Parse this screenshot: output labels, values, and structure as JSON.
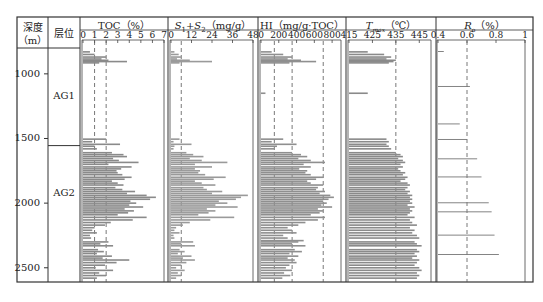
{
  "headers": {
    "depth": "深度",
    "depth_unit": "（m）",
    "layer": "层位",
    "toc": "TOC（%）",
    "s1s2": "S₁+S₂（mg/g）",
    "hi": "HI（mg/g·TOC）",
    "tmax": "Tmax（℃）",
    "ro": "Ro（%）"
  },
  "depth_ticks": [
    "1000",
    "1500",
    "2000",
    "2500"
  ],
  "layers": [
    {
      "name": "AG1",
      "top": 800,
      "bottom": 1555
    },
    {
      "name": "AG2",
      "top": 1555,
      "bottom": 2610
    }
  ],
  "chart_data": {
    "type": "bar",
    "orientation": "horizontal",
    "title": "",
    "ylabel": "深度（m）",
    "ylim": [
      800,
      2610
    ],
    "y_ticks": [
      1000,
      1500,
      2000,
      2500
    ],
    "tracks": [
      {
        "name": "TOC",
        "xlabel": "TOC（%）",
        "xlim": [
          0,
          7
        ],
        "x_ticks": [
          "0",
          "1",
          "2",
          "3",
          "4",
          "5",
          "6",
          "7"
        ],
        "ref_lines": [
          1,
          2
        ],
        "samples": [
          [
            830,
            0.6
          ],
          [
            850,
            1.0
          ],
          [
            870,
            2.0
          ],
          [
            885,
            1.6
          ],
          [
            895,
            2.2
          ],
          [
            905,
            3.8
          ],
          [
            915,
            1.4
          ],
          [
            1505,
            2.0
          ],
          [
            1525,
            0.8
          ],
          [
            1545,
            3.2
          ],
          [
            1560,
            1.0
          ],
          [
            1580,
            1.2
          ],
          [
            1610,
            2.5
          ],
          [
            1625,
            3.5
          ],
          [
            1640,
            3.8
          ],
          [
            1655,
            2.6
          ],
          [
            1670,
            3.1
          ],
          [
            1685,
            4.8
          ],
          [
            1700,
            2.2
          ],
          [
            1720,
            4.2
          ],
          [
            1735,
            3.3
          ],
          [
            1750,
            2.9
          ],
          [
            1765,
            3.0
          ],
          [
            1780,
            3.4
          ],
          [
            1800,
            4.2
          ],
          [
            1815,
            3.6
          ],
          [
            1830,
            2.5
          ],
          [
            1845,
            3.0
          ],
          [
            1860,
            3.5
          ],
          [
            1880,
            2.8
          ],
          [
            1895,
            3.4
          ],
          [
            1910,
            4.5
          ],
          [
            1925,
            3.8
          ],
          [
            1940,
            5.5
          ],
          [
            1955,
            6.3
          ],
          [
            1970,
            5.8
          ],
          [
            1985,
            4.1
          ],
          [
            2000,
            4.6
          ],
          [
            2015,
            4.0
          ],
          [
            2030,
            5.2
          ],
          [
            2045,
            3.6
          ],
          [
            2060,
            4.4
          ],
          [
            2075,
            3.9
          ],
          [
            2090,
            3.0
          ],
          [
            2110,
            5.5
          ],
          [
            2130,
            4.3
          ],
          [
            2150,
            2.4
          ],
          [
            2170,
            1.9
          ],
          [
            2190,
            1.0
          ],
          [
            2210,
            0.8
          ],
          [
            2230,
            1.2
          ],
          [
            2250,
            0.6
          ],
          [
            2270,
            0.7
          ],
          [
            2300,
            2.2
          ],
          [
            2315,
            1.5
          ],
          [
            2330,
            2.6
          ],
          [
            2360,
            1.3
          ],
          [
            2375,
            1.8
          ],
          [
            2390,
            1.2
          ],
          [
            2410,
            2.5
          ],
          [
            2425,
            1.7
          ],
          [
            2440,
            4.0
          ],
          [
            2460,
            2.9
          ],
          [
            2480,
            1.9
          ],
          [
            2500,
            1.1
          ],
          [
            2520,
            2.6
          ],
          [
            2540,
            1.4
          ],
          [
            2560,
            2.0
          ],
          [
            2580,
            1.2
          ]
        ]
      },
      {
        "name": "S1+S2",
        "xlabel": "S₁+S₂（mg/g）",
        "xlim": [
          0,
          48
        ],
        "x_ticks": [
          "0",
          "12",
          "24",
          "36",
          "48"
        ],
        "ref_lines": [
          6
        ],
        "samples": [
          [
            830,
            2.0
          ],
          [
            850,
            4.5
          ],
          [
            870,
            6.0
          ],
          [
            885,
            3.5
          ],
          [
            895,
            11.0
          ],
          [
            905,
            24.0
          ],
          [
            915,
            5.0
          ],
          [
            1505,
            5.0
          ],
          [
            1525,
            1.5
          ],
          [
            1545,
            12.0
          ],
          [
            1560,
            2.0
          ],
          [
            1580,
            1.5
          ],
          [
            1610,
            9.0
          ],
          [
            1625,
            13.0
          ],
          [
            1640,
            19.0
          ],
          [
            1655,
            11.0
          ],
          [
            1670,
            18.0
          ],
          [
            1685,
            33.0
          ],
          [
            1700,
            14.0
          ],
          [
            1720,
            24.0
          ],
          [
            1735,
            14.0
          ],
          [
            1750,
            17.0
          ],
          [
            1765,
            16.0
          ],
          [
            1780,
            20.0
          ],
          [
            1800,
            32.0
          ],
          [
            1815,
            25.0
          ],
          [
            1830,
            14.0
          ],
          [
            1845,
            18.0
          ],
          [
            1860,
            26.0
          ],
          [
            1880,
            19.0
          ],
          [
            1895,
            21.0
          ],
          [
            1910,
            30.0
          ],
          [
            1925,
            24.0
          ],
          [
            1940,
            45.0
          ],
          [
            1955,
            41.0
          ],
          [
            1970,
            38.0
          ],
          [
            1985,
            28.0
          ],
          [
            2000,
            33.0
          ],
          [
            2015,
            26.0
          ],
          [
            2030,
            39.0
          ],
          [
            2045,
            21.0
          ],
          [
            2060,
            26.0
          ],
          [
            2075,
            22.0
          ],
          [
            2090,
            16.0
          ],
          [
            2110,
            37.0
          ],
          [
            2130,
            23.0
          ],
          [
            2150,
            11.0
          ],
          [
            2170,
            7.0
          ],
          [
            2190,
            3.0
          ],
          [
            2210,
            2.0
          ],
          [
            2230,
            5.0
          ],
          [
            2250,
            1.5
          ],
          [
            2270,
            2.0
          ],
          [
            2300,
            13.0
          ],
          [
            2315,
            6.0
          ],
          [
            2330,
            14.0
          ],
          [
            2360,
            5.0
          ],
          [
            2375,
            8.0
          ],
          [
            2390,
            4.0
          ],
          [
            2410,
            12.0
          ],
          [
            2425,
            7.0
          ],
          [
            2440,
            14.0
          ],
          [
            2460,
            9.0
          ],
          [
            2480,
            6.0
          ],
          [
            2500,
            3.0
          ],
          [
            2520,
            8.0
          ],
          [
            2540,
            4.0
          ],
          [
            2560,
            6.0
          ],
          [
            2580,
            3.0
          ]
        ]
      },
      {
        "name": "HI",
        "xlabel": "HI（mg/g·TOC）",
        "xlim": [
          0,
          900
        ],
        "x_ticks": [
          "0",
          "200",
          "400",
          "600",
          "800"
        ],
        "ref_lines": [
          150,
          350,
          700
        ],
        "samples": [
          [
            830,
            120
          ],
          [
            850,
            250
          ],
          [
            870,
            350
          ],
          [
            885,
            300
          ],
          [
            895,
            450
          ],
          [
            905,
            620
          ],
          [
            915,
            320
          ],
          [
            1150,
            50
          ],
          [
            1505,
            250
          ],
          [
            1525,
            120
          ],
          [
            1545,
            400
          ],
          [
            1560,
            180
          ],
          [
            1580,
            150
          ],
          [
            1610,
            350
          ],
          [
            1625,
            450
          ],
          [
            1640,
            520
          ],
          [
            1655,
            420
          ],
          [
            1670,
            560
          ],
          [
            1685,
            720
          ],
          [
            1700,
            480
          ],
          [
            1720,
            560
          ],
          [
            1735,
            430
          ],
          [
            1750,
            520
          ],
          [
            1765,
            500
          ],
          [
            1780,
            560
          ],
          [
            1800,
            700
          ],
          [
            1815,
            620
          ],
          [
            1830,
            520
          ],
          [
            1845,
            560
          ],
          [
            1860,
            700
          ],
          [
            1880,
            640
          ],
          [
            1895,
            620
          ],
          [
            1910,
            720
          ],
          [
            1925,
            660
          ],
          [
            1940,
            780
          ],
          [
            1955,
            820
          ],
          [
            1970,
            760
          ],
          [
            1985,
            700
          ],
          [
            2000,
            740
          ],
          [
            2015,
            680
          ],
          [
            2030,
            800
          ],
          [
            2045,
            640
          ],
          [
            2060,
            700
          ],
          [
            2075,
            660
          ],
          [
            2090,
            560
          ],
          [
            2110,
            720
          ],
          [
            2130,
            640
          ],
          [
            2150,
            500
          ],
          [
            2170,
            420
          ],
          [
            2190,
            300
          ],
          [
            2210,
            350
          ],
          [
            2230,
            400
          ],
          [
            2250,
            250
          ],
          [
            2270,
            300
          ],
          [
            2290,
            480
          ],
          [
            2300,
            420
          ],
          [
            2315,
            350
          ],
          [
            2330,
            500
          ],
          [
            2360,
            380
          ],
          [
            2375,
            460
          ],
          [
            2390,
            320
          ],
          [
            2410,
            420
          ],
          [
            2425,
            300
          ],
          [
            2440,
            380
          ],
          [
            2460,
            400
          ],
          [
            2480,
            320
          ],
          [
            2500,
            280
          ],
          [
            2520,
            350
          ],
          [
            2540,
            260
          ],
          [
            2560,
            330
          ],
          [
            2580,
            240
          ]
        ]
      },
      {
        "name": "Tmax",
        "xlabel": "Tmax（℃）",
        "xlim": [
          415,
          450
        ],
        "x_ticks": [
          "415",
          "425",
          "435",
          "445"
        ],
        "ref_lines": [
          435
        ],
        "samples": [
          [
            830,
            423
          ],
          [
            850,
            430
          ],
          [
            870,
            433
          ],
          [
            885,
            431
          ],
          [
            895,
            435
          ],
          [
            905,
            434
          ],
          [
            915,
            432
          ],
          [
            1150,
            423
          ],
          [
            1505,
            431
          ],
          [
            1525,
            432
          ],
          [
            1545,
            431
          ],
          [
            1560,
            432
          ],
          [
            1580,
            433
          ],
          [
            1610,
            435
          ],
          [
            1625,
            437
          ],
          [
            1640,
            438
          ],
          [
            1655,
            436
          ],
          [
            1670,
            438
          ],
          [
            1685,
            439
          ],
          [
            1700,
            437
          ],
          [
            1720,
            438
          ],
          [
            1735,
            436
          ],
          [
            1750,
            437
          ],
          [
            1765,
            439
          ],
          [
            1780,
            438
          ],
          [
            1800,
            440
          ],
          [
            1815,
            439
          ],
          [
            1830,
            437
          ],
          [
            1845,
            440
          ],
          [
            1860,
            441
          ],
          [
            1880,
            440
          ],
          [
            1895,
            439
          ],
          [
            1910,
            441
          ],
          [
            1925,
            440
          ],
          [
            1940,
            442
          ],
          [
            1955,
            441
          ],
          [
            1970,
            442
          ],
          [
            1985,
            441
          ],
          [
            2000,
            442
          ],
          [
            2015,
            440
          ],
          [
            2030,
            443
          ],
          [
            2045,
            441
          ],
          [
            2060,
            442
          ],
          [
            2075,
            441
          ],
          [
            2090,
            440
          ],
          [
            2110,
            443
          ],
          [
            2130,
            441
          ],
          [
            2150,
            442
          ],
          [
            2170,
            444
          ],
          [
            2190,
            441
          ],
          [
            2210,
            443
          ],
          [
            2230,
            442
          ],
          [
            2250,
            444
          ],
          [
            2270,
            445
          ],
          [
            2300,
            443
          ],
          [
            2315,
            444
          ],
          [
            2330,
            446
          ],
          [
            2360,
            444
          ],
          [
            2375,
            445
          ],
          [
            2390,
            443
          ],
          [
            2410,
            444
          ],
          [
            2425,
            442
          ],
          [
            2440,
            445
          ],
          [
            2460,
            444
          ],
          [
            2480,
            443
          ],
          [
            2500,
            445
          ],
          [
            2520,
            446
          ],
          [
            2540,
            444
          ],
          [
            2560,
            445
          ],
          [
            2580,
            444
          ]
        ]
      },
      {
        "name": "Ro",
        "xlabel": "Ro（%）",
        "xlim": [
          0.4,
          1.0
        ],
        "x_ticks": [
          "0.4",
          "0.6",
          "0.8",
          "1"
        ],
        "ref_lines": [
          0.6
        ],
        "samples": [
          [
            830,
            0.44
          ],
          [
            1100,
            0.62
          ],
          [
            1390,
            0.55
          ],
          [
            1510,
            0.6
          ],
          [
            1660,
            0.67
          ],
          [
            1800,
            0.7
          ],
          [
            2000,
            0.75
          ],
          [
            2070,
            0.77
          ],
          [
            2250,
            0.79
          ],
          [
            2400,
            0.82
          ]
        ]
      }
    ]
  }
}
